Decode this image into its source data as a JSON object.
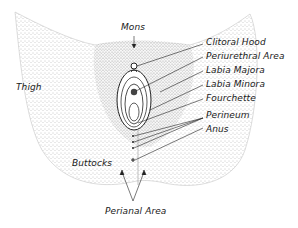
{
  "figure": {
    "labels": {
      "mons": "Mons",
      "clitoral_hood": "Clitoral Hood",
      "periurethral_area": "Periurethral Area",
      "labia_majora": "Labia Majora",
      "labia_minora": "Labia Minora",
      "fourchette": "Fourchette",
      "perineum": "Perineum",
      "anus": "Anus",
      "thigh": "Thigh",
      "buttocks": "Buttocks",
      "perianal_area": "Perianal Area"
    },
    "colors": {
      "ink": "#1a1a1a",
      "stipple": "#8a8a8a",
      "background": "#ffffff"
    }
  }
}
